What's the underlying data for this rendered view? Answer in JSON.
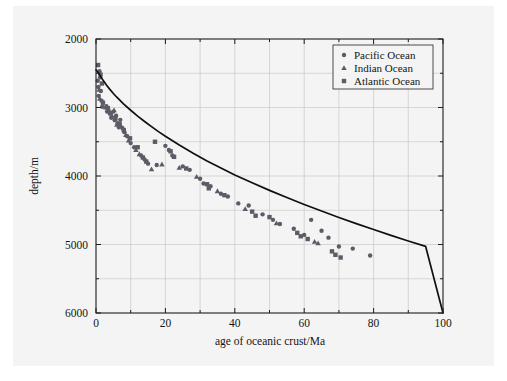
{
  "figure": {
    "background_color": "#f4f4f4",
    "page_color": "#ffffff"
  },
  "chart_data": {
    "type": "scatter",
    "title": "",
    "xlabel": "age of oceanic crust/Ma",
    "ylabel": "depth/m",
    "xlim": [
      0,
      100
    ],
    "ylim": [
      2000,
      6000
    ],
    "y_inverted": true,
    "grid": true,
    "x_major_ticks": [
      0,
      20,
      40,
      60,
      80,
      100
    ],
    "x_minor_ticks": [
      10,
      30,
      50,
      70,
      90
    ],
    "y_major_ticks": [
      2000,
      3000,
      4000,
      5000,
      6000
    ],
    "y_minor_ticks": [
      2500,
      3500,
      4500,
      5500
    ],
    "x_tick_labels": [
      "0",
      "20",
      "40",
      "60",
      "80",
      "100"
    ],
    "y_tick_labels": [
      "2000",
      "3000",
      "4000",
      "5000",
      "6000"
    ],
    "legend": {
      "position": "top-right",
      "entries": [
        {
          "label": "Pacific Ocean",
          "marker": "circle"
        },
        {
          "label": "Indian Ocean",
          "marker": "triangle"
        },
        {
          "label": "Atlantic Ocean",
          "marker": "square"
        }
      ]
    },
    "model_curve": {
      "name": "half-space cooling model",
      "points": [
        [
          0,
          2450
        ],
        [
          1,
          2520
        ],
        [
          2,
          2600
        ],
        [
          3,
          2672
        ],
        [
          4,
          2735
        ],
        [
          5,
          2795
        ],
        [
          6,
          2850
        ],
        [
          8,
          2950
        ],
        [
          10,
          3040
        ],
        [
          12,
          3125
        ],
        [
          14,
          3205
        ],
        [
          16,
          3280
        ],
        [
          18,
          3352
        ],
        [
          20,
          3420
        ],
        [
          24,
          3548
        ],
        [
          28,
          3668
        ],
        [
          32,
          3780
        ],
        [
          36,
          3885
        ],
        [
          40,
          3985
        ],
        [
          45,
          4100
        ],
        [
          50,
          4210
        ],
        [
          55,
          4315
        ],
        [
          60,
          4415
        ],
        [
          65,
          4512
        ],
        [
          70,
          4605
        ],
        [
          75,
          4695
        ],
        [
          80,
          4782
        ],
        [
          85,
          4866
        ],
        [
          90,
          4948
        ],
        [
          95,
          5028
        ],
        [
          100,
          6000
        ]
      ]
    },
    "series": [
      {
        "name": "Pacific Ocean",
        "marker": "circle",
        "points": [
          [
            0.5,
            2610
          ],
          [
            0.7,
            2700
          ],
          [
            0.8,
            2830
          ],
          [
            1.0,
            2470
          ],
          [
            1.2,
            2560
          ],
          [
            1.4,
            2760
          ],
          [
            1.6,
            2900
          ],
          [
            1.8,
            2990
          ],
          [
            3.0,
            2980
          ],
          [
            3.2,
            3060
          ],
          [
            3.6,
            3035
          ],
          [
            4.0,
            3090
          ],
          [
            4.4,
            3150
          ],
          [
            5.0,
            3060
          ],
          [
            5.4,
            3185
          ],
          [
            5.8,
            3120
          ],
          [
            6.2,
            3230
          ],
          [
            6.6,
            3290
          ],
          [
            7.0,
            3180
          ],
          [
            7.6,
            3300
          ],
          [
            8.2,
            3360
          ],
          [
            9.0,
            3420
          ],
          [
            10.0,
            3520
          ],
          [
            11.0,
            3580
          ],
          [
            13.0,
            3700
          ],
          [
            14.0,
            3760
          ],
          [
            15.0,
            3820
          ],
          [
            17.5,
            3840
          ],
          [
            20.0,
            3560
          ],
          [
            21.0,
            3620
          ],
          [
            22.0,
            3700
          ],
          [
            25.0,
            3860
          ],
          [
            27.0,
            3910
          ],
          [
            30.0,
            4040
          ],
          [
            31.0,
            4110
          ],
          [
            33.0,
            4150
          ],
          [
            36.0,
            4260
          ],
          [
            38.0,
            4300
          ],
          [
            41.0,
            4400
          ],
          [
            44.0,
            4430
          ],
          [
            48.0,
            4560
          ],
          [
            51.0,
            4640
          ],
          [
            53.0,
            4700
          ],
          [
            57.0,
            4770
          ],
          [
            60.0,
            4860
          ],
          [
            62.0,
            4640
          ],
          [
            65.0,
            4800
          ],
          [
            67.0,
            4900
          ],
          [
            70.0,
            5030
          ],
          [
            74.0,
            5060
          ],
          [
            79.0,
            5160
          ]
        ]
      },
      {
        "name": "Indian Ocean",
        "marker": "triangle",
        "points": [
          [
            0.9,
            2740
          ],
          [
            1.1,
            2870
          ],
          [
            2.8,
            3000
          ],
          [
            4.6,
            3120
          ],
          [
            5.2,
            3040
          ],
          [
            6.0,
            3250
          ],
          [
            7.2,
            3270
          ],
          [
            8.6,
            3400
          ],
          [
            9.4,
            3480
          ],
          [
            11.5,
            3620
          ],
          [
            12.5,
            3680
          ],
          [
            16.0,
            3900
          ],
          [
            19.0,
            3830
          ],
          [
            24.0,
            3880
          ],
          [
            29.0,
            4010
          ],
          [
            35.0,
            4220
          ],
          [
            43.0,
            4480
          ],
          [
            52.0,
            4690
          ],
          [
            63.0,
            4960
          ],
          [
            64.0,
            4980
          ]
        ]
      },
      {
        "name": "Atlantic Ocean",
        "marker": "square",
        "points": [
          [
            0.6,
            2380
          ],
          [
            1.3,
            2520
          ],
          [
            1.7,
            2650
          ],
          [
            2.0,
            2930
          ],
          [
            3.4,
            3010
          ],
          [
            4.2,
            3080
          ],
          [
            5.6,
            3160
          ],
          [
            6.8,
            3240
          ],
          [
            8.0,
            3330
          ],
          [
            9.8,
            3450
          ],
          [
            12.0,
            3580
          ],
          [
            13.5,
            3730
          ],
          [
            14.5,
            3790
          ],
          [
            17.0,
            3500
          ],
          [
            21.5,
            3640
          ],
          [
            22.5,
            3720
          ],
          [
            26.0,
            3890
          ],
          [
            32.0,
            4120
          ],
          [
            32.5,
            4180
          ],
          [
            37.0,
            4280
          ],
          [
            45.0,
            4520
          ],
          [
            46.0,
            4580
          ],
          [
            50.0,
            4600
          ],
          [
            58.0,
            4830
          ],
          [
            59.0,
            4880
          ],
          [
            61.0,
            4920
          ],
          [
            68.0,
            5100
          ],
          [
            69.0,
            5150
          ],
          [
            70.5,
            5190
          ]
        ]
      }
    ]
  }
}
